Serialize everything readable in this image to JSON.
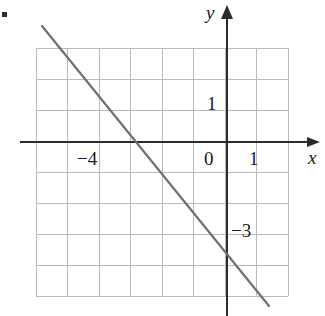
{
  "figure": {
    "kind": "cartesian-line-graph",
    "width": 325,
    "height": 316,
    "background_color": "#ffffff",
    "corner_mark": {
      "name": "scan-artifact-dot",
      "color": "#2b2b2b"
    }
  },
  "axes": {
    "x_axis": {
      "label": "x",
      "color": "#2b2b2b",
      "arrow": "right"
    },
    "y_axis": {
      "label": "y",
      "color": "#2b2b2b",
      "arrow": "up"
    },
    "origin_label": "0"
  },
  "tick_labels": {
    "x_negative": "−4",
    "x_positive": "1",
    "y_positive": "1",
    "y_negative": "−3"
  },
  "grid": {
    "color": "#b9b9bd",
    "columns": 8,
    "rows": 8,
    "cell_size_px": 31.5,
    "left_px": 36,
    "top_px": 48,
    "right_px": 288,
    "bottom_px": 296
  },
  "chart_data": {
    "type": "line",
    "title": "",
    "xlabel": "x",
    "ylabel": "y",
    "grid": true,
    "legend": "none",
    "xlim": [
      -6,
      2
    ],
    "ylim": [
      -6,
      3
    ],
    "xticks": [
      -4,
      0,
      1
    ],
    "yticks": [
      -3,
      0,
      1
    ],
    "xtick_labels": [
      "−4",
      "0",
      "1"
    ],
    "ytick_labels": [
      "−3",
      "0",
      "1"
    ],
    "series": [
      {
        "name": "line",
        "equation": "y = -1.33x - 4",
        "slope": -1.33,
        "intercept": -4,
        "color": "#707070",
        "x_intercept": -3,
        "y_intercept": -4,
        "points": [
          {
            "x": -6.0,
            "y": 4.0
          },
          {
            "x": -3.0,
            "y": 0.0
          },
          {
            "x": 0.0,
            "y": -4.0
          },
          {
            "x": 1.3,
            "y": -5.3
          }
        ]
      }
    ]
  },
  "line_geometry": {
    "x1_px": 42,
    "y1_px": 26,
    "x2_px": 269,
    "y2_px": 306,
    "stroke_color": "#707070",
    "stroke_width": 2.2
  }
}
